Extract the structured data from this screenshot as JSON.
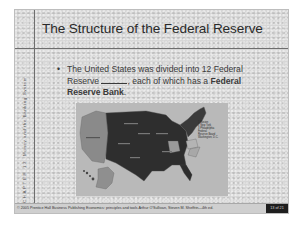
{
  "slide": {
    "title": "The Structure of the Federal Reserve",
    "side_label": {
      "chapter": "CHAPTER 13",
      "topic": "Money and the Banking System"
    },
    "bullet": {
      "marker": "•",
      "text_part1": "The United States was divided into 12 Federal Reserve ",
      "text_part2": ", each of which has a ",
      "bold_text": "Federal Reserve Bank",
      "text_end": "."
    },
    "map": {
      "legend": [
        "1 Boston",
        "2 New York",
        "3 Philadelphia",
        "Federal",
        "Reserve Board",
        "Washington, D.C."
      ]
    },
    "footer": {
      "copyright": "© 2005 Prentice Hall Business Publishing   Economics: principles and tools  Arthur O'Sullivan, Steven M. Sheffrin—4th ed.",
      "slide_number": "13 of 21"
    }
  }
}
